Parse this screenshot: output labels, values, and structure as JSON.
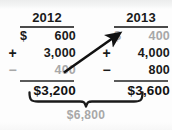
{
  "figure": {
    "name": "two-year-addition-worksheet",
    "colors": {
      "ink": "#1a1a1a",
      "muted": "#a8a8a8",
      "rule": "#4a4a4a",
      "background": "#fdfdfd"
    }
  },
  "columns": [
    {
      "year": "2012",
      "rows": [
        {
          "operator": "",
          "currency": "$",
          "amount": "600",
          "muted": false
        },
        {
          "operator": "+",
          "currency": "",
          "amount": "3,000",
          "muted": false
        },
        {
          "operator": "−",
          "currency": "",
          "amount": "400",
          "muted": true
        }
      ],
      "total": "$3,200"
    },
    {
      "year": "2013",
      "rows": [
        {
          "operator": "",
          "currency": "$",
          "amount": "400",
          "muted": true
        },
        {
          "operator": "+",
          "currency": "",
          "amount": "4,000",
          "muted": false
        },
        {
          "operator": "−",
          "currency": "",
          "amount": "800",
          "muted": false
        }
      ],
      "total": "$3,600"
    }
  ],
  "annotation": {
    "arrow_label": "carry-forward-arrow",
    "brace_label": "combined-total-brace",
    "grand_total": "$6,800"
  }
}
